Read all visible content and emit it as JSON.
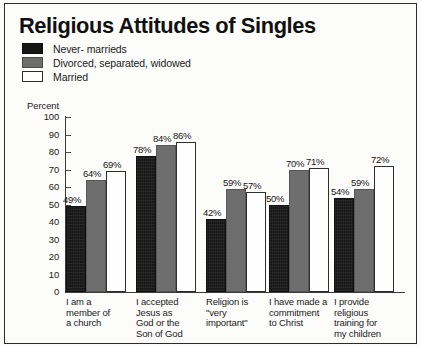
{
  "title": "Religious Attitudes of Singles",
  "legend": {
    "items": [
      {
        "label": "Never- marrieds",
        "swatch": "black",
        "color": "#151515"
      },
      {
        "label": "Divorced, separated, widowed",
        "swatch": "gray",
        "color": "#6d6d6d"
      },
      {
        "label": "Married",
        "swatch": "white",
        "color": "#ffffff"
      }
    ]
  },
  "axis": {
    "ylabel": "Percent",
    "ticks": [
      "100",
      "90",
      "80",
      "70",
      "60",
      "50",
      "40",
      "30",
      "20",
      "10",
      "0"
    ]
  },
  "chart_data": {
    "type": "bar",
    "title": "Religious Attitudes of Singles",
    "xlabel": "",
    "ylabel": "Percent",
    "ylim": [
      0,
      100
    ],
    "ytick_step": 10,
    "grid": false,
    "legend_position": "top-left",
    "value_suffix": "%",
    "categories": [
      "I am a\nmember of\na church",
      "I accepted\nJesus as\nGod or the\nSon of God",
      "Religion is\n\"very\nimportant\"",
      "I have made a\ncommitment\nto Christ",
      "I provide\nreligious\ntraining for\nmy children"
    ],
    "series": [
      {
        "name": "Never- marrieds",
        "values": [
          49,
          78,
          42,
          50,
          54
        ],
        "labels": [
          "49%",
          "78%",
          "42%",
          "50%",
          "54%"
        ]
      },
      {
        "name": "Divorced, separated, widowed",
        "values": [
          64,
          84,
          59,
          70,
          59
        ],
        "labels": [
          "64%",
          "84%",
          "59%",
          "70%",
          "59%"
        ]
      },
      {
        "name": "Married",
        "values": [
          69,
          86,
          57,
          71,
          72
        ],
        "labels": [
          "69%",
          "86%",
          "57%",
          "71%",
          "72%"
        ]
      }
    ]
  }
}
